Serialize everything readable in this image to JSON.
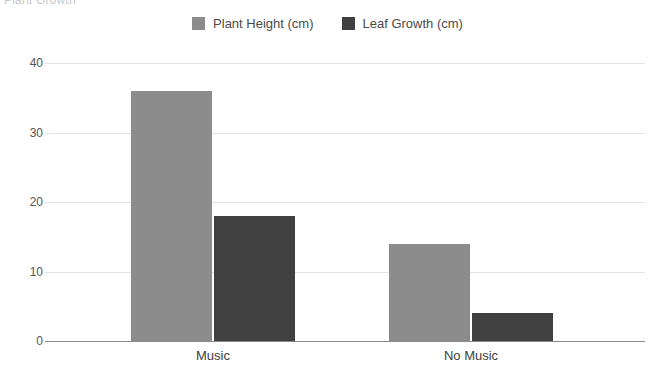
{
  "chart_data": {
    "type": "bar",
    "title": "Plant Growth",
    "xlabel": "",
    "ylabel": "",
    "categories": [
      "Music",
      "No Music"
    ],
    "series": [
      {
        "name": "Plant Height (cm)",
        "values": [
          36,
          14
        ],
        "color": "#8c8c8c"
      },
      {
        "name": "Leaf Growth (cm)",
        "values": [
          18,
          4
        ],
        "color": "#404040"
      }
    ],
    "ylim": [
      0,
      40
    ],
    "yticks": [
      0,
      10,
      20,
      30,
      40
    ],
    "ytick_labels": [
      "0",
      "10",
      "20",
      "30",
      "40"
    ],
    "grid": true,
    "legend_position": "top-center"
  }
}
